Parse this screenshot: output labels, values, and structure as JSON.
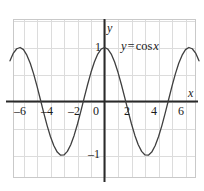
{
  "figure": {
    "name": "cosine-graph",
    "background_color": "#ffffff"
  },
  "chart_data": {
    "type": "line",
    "title": "",
    "subtitle": "",
    "xlabel": "x",
    "ylabel": "y",
    "expression": "y = cos x",
    "function": "cos",
    "amplitude": 1,
    "period": 6.283185307179586,
    "xlim": [
      -7,
      7
    ],
    "ylim": [
      -1.55,
      1.55
    ],
    "grid": true,
    "grid_step_x": 1,
    "grid_step_y": 0.5,
    "legend": "none",
    "x_tick_labels": [
      "–6",
      "–4",
      "–2",
      "0",
      "2",
      "4",
      "6"
    ],
    "x_ticks": [
      -6,
      -4,
      -2,
      0,
      2,
      4,
      6
    ],
    "y_tick_labels": [
      "1",
      "–1"
    ],
    "y_ticks": [
      1,
      -1
    ],
    "series": [
      {
        "name": "y = cos x",
        "color": "#3f3f3f",
        "x": [
          -7.0,
          -6.75,
          -6.5,
          -6.25,
          -6.0,
          -5.75,
          -5.5,
          -5.25,
          -5.0,
          -4.75,
          -4.5,
          -4.25,
          -4.0,
          -3.75,
          -3.5,
          -3.25,
          -3.0,
          -2.75,
          -2.5,
          -2.25,
          -2.0,
          -1.75,
          -1.5,
          -1.25,
          -1.0,
          -0.75,
          -0.5,
          -0.25,
          0.0,
          0.25,
          0.5,
          0.75,
          1.0,
          1.25,
          1.5,
          1.75,
          2.0,
          2.25,
          2.5,
          2.75,
          3.0,
          3.25,
          3.5,
          3.75,
          4.0,
          4.25,
          4.5,
          4.75,
          5.0,
          5.25,
          5.5,
          5.75,
          6.0,
          6.25,
          6.5,
          6.75,
          7.0
        ],
        "y": [
          0.7539,
          0.8968,
          0.9766,
          0.9999,
          0.9602,
          0.8577,
          0.7087,
          0.5121,
          0.2837,
          0.0376,
          -0.2108,
          -0.4461,
          -0.6536,
          -0.8206,
          -0.9365,
          -0.994,
          -0.99,
          -0.9243,
          -0.8011,
          -0.6282,
          -0.4161,
          -0.1782,
          0.0707,
          0.3153,
          0.5403,
          0.7317,
          0.8776,
          0.9689,
          1.0,
          0.9689,
          0.8776,
          0.7317,
          0.5403,
          0.3153,
          0.0707,
          -0.1782,
          -0.4161,
          -0.6282,
          -0.8011,
          -0.9243,
          -0.99,
          -0.994,
          -0.9365,
          -0.8206,
          -0.6536,
          -0.4461,
          -0.2108,
          0.0376,
          0.2837,
          0.5121,
          0.7087,
          0.8577,
          0.9602,
          0.9999,
          0.9766,
          0.8968,
          0.7539
        ]
      }
    ],
    "colors": {
      "curve": "#3f3f3f",
      "axis": "#2a2a2a",
      "grid": "#dcdcdc",
      "grid_border": "#c9c9c9",
      "text": "#1b1b1b"
    }
  },
  "labels": {
    "curve_equation": {
      "lhs": "y",
      "operator": "=",
      "rhs_fn": "cos",
      "rhs_var": "x"
    },
    "x_axis_name": "x",
    "y_axis_name": "y",
    "y_top": "1",
    "y_bottom": "–1",
    "x_neg6": "–6",
    "x_neg4": "–4",
    "x_neg2": "–2",
    "x_zero": "0",
    "x_pos2": "2",
    "x_pos4": "4",
    "x_pos6": "6"
  }
}
